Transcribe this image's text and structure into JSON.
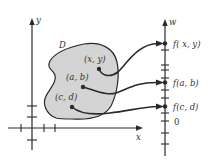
{
  "diagram": {
    "colors": {
      "region_fill": "#d4d4d4",
      "ink": "#2a2a2a",
      "background": "#ffffff"
    },
    "xy_plane": {
      "x_axis_label": "x",
      "y_axis_label": "y",
      "region_label": "D",
      "points": [
        {
          "id": "xy",
          "label": "(x, y)"
        },
        {
          "id": "ab",
          "label": "(a, b)"
        },
        {
          "id": "cd",
          "label": "(c, d)"
        }
      ]
    },
    "w_axis": {
      "axis_label": "w",
      "origin_label": "0",
      "values": [
        {
          "id": "fxy",
          "label": "f( x, y)"
        },
        {
          "id": "fab",
          "label": "f(a, b)"
        },
        {
          "id": "fcd",
          "label": "f(c, d)"
        }
      ]
    },
    "mappings": [
      {
        "from": "(x, y)",
        "to": "f( x, y)"
      },
      {
        "from": "(a, b)",
        "to": "f(a, b)"
      },
      {
        "from": "(c, d)",
        "to": "f(c, d)"
      }
    ]
  }
}
